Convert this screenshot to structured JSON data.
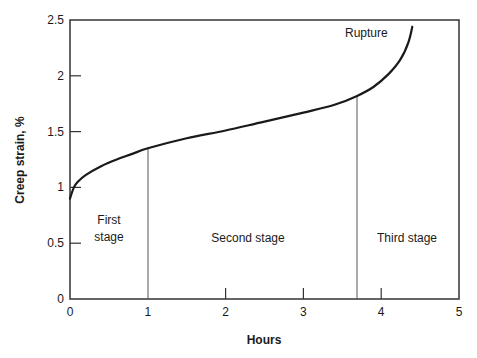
{
  "chart_data": {
    "type": "line",
    "title": "",
    "xlabel": "Hours",
    "ylabel": "Creep strain, %",
    "xlim": [
      0,
      5
    ],
    "ylim": [
      0,
      2.5
    ],
    "x_ticks": [
      "0",
      "1",
      "2",
      "3",
      "4",
      "5"
    ],
    "y_ticks": [
      "0",
      "0.5",
      "1",
      "1.5",
      "2",
      "2.5"
    ],
    "grid": false,
    "legend": null,
    "series": [
      {
        "name": "Creep curve",
        "x": [
          0,
          0.05,
          0.1,
          0.2,
          0.4,
          0.6,
          0.8,
          1.0,
          1.5,
          2.0,
          2.5,
          3.0,
          3.4,
          3.69,
          3.9,
          4.1,
          4.25,
          4.35,
          4.4
        ],
        "y": [
          0.9,
          1.0,
          1.05,
          1.11,
          1.19,
          1.25,
          1.3,
          1.35,
          1.44,
          1.51,
          1.59,
          1.67,
          1.74,
          1.82,
          1.9,
          2.02,
          2.15,
          2.3,
          2.44
        ]
      }
    ],
    "stage_boundaries": [
      1.0,
      3.69
    ],
    "annotations": [
      {
        "text": "Rupture",
        "x": 3.85,
        "y": 2.4
      },
      {
        "text": "First",
        "x": 0.5,
        "y": 0.72
      },
      {
        "text": "stage",
        "x": 0.5,
        "y": 0.57
      },
      {
        "text": "Second stage",
        "x": 2.35,
        "y": 0.57
      },
      {
        "text": "Third stage",
        "x": 4.34,
        "y": 0.57
      }
    ]
  },
  "labels": {
    "rupture": "Rupture",
    "first_stage_line1": "First",
    "first_stage_line2": "stage",
    "second_stage": "Second stage",
    "third_stage": "Third stage",
    "xlabel": "Hours",
    "ylabel": "Creep strain, %"
  },
  "ticks": {
    "x": [
      "0",
      "1",
      "2",
      "3",
      "4",
      "5"
    ],
    "y": [
      "0",
      "0.5",
      "1",
      "1.5",
      "2",
      "2.5"
    ]
  },
  "colors": {
    "line": "#1a1a1a",
    "frame": "#333333",
    "divider": "#555555"
  }
}
